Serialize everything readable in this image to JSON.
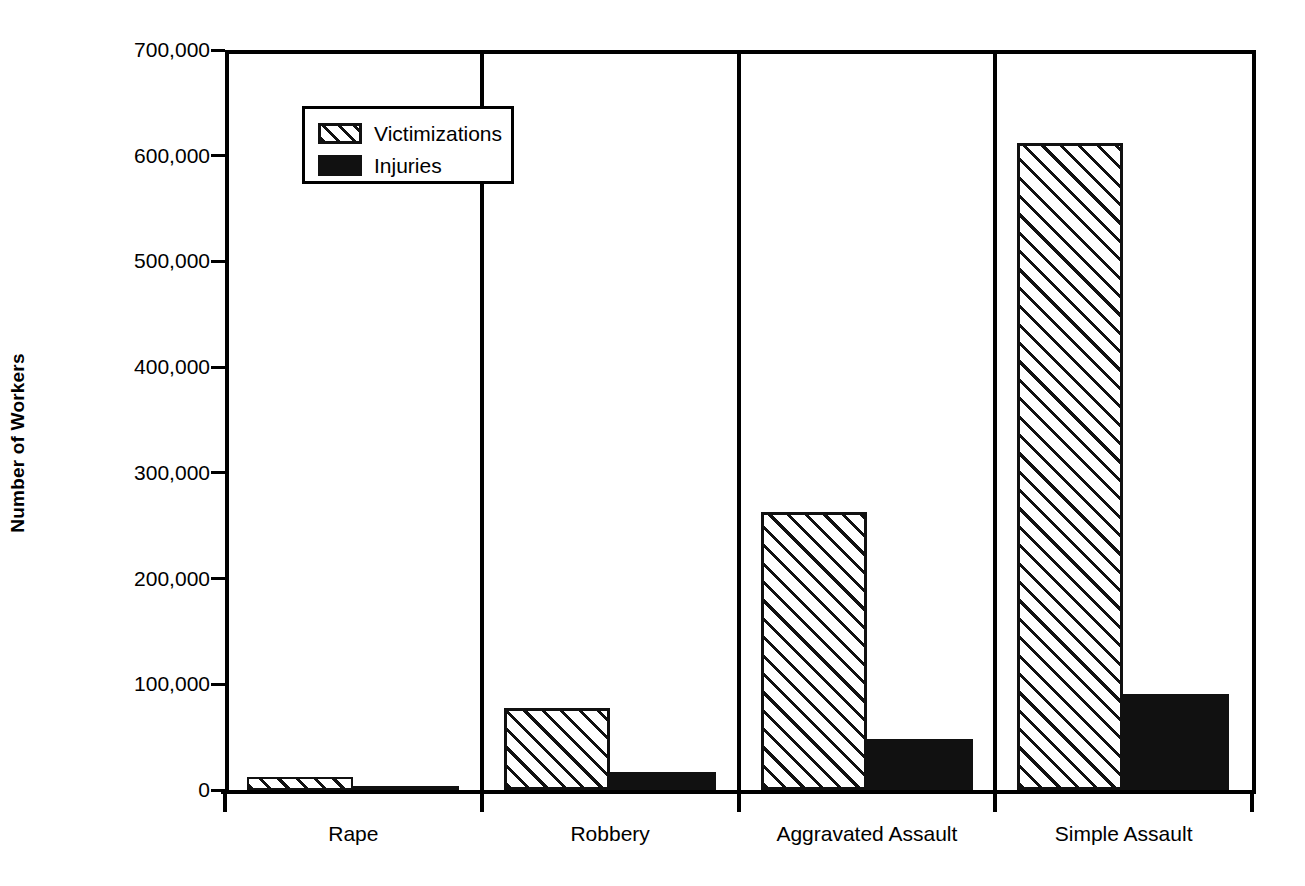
{
  "chart_data": {
    "type": "bar",
    "title": "",
    "xlabel": "",
    "ylabel": "Number of Workers",
    "ylim": [
      0,
      700000
    ],
    "yticks": [
      0,
      100000,
      200000,
      300000,
      400000,
      500000,
      600000,
      700000
    ],
    "ytick_labels": [
      "0",
      "100,000",
      "200,000",
      "300,000",
      "400,000",
      "500,000",
      "600,000",
      "700,000"
    ],
    "categories": [
      "Rape",
      "Robbery",
      "Aggravated Assault",
      "Simple Assault"
    ],
    "grid": false,
    "legend_position": "upper-left-inside",
    "series": [
      {
        "name": "Victimizations",
        "fill": "diagonal-hatch",
        "color": "#111111",
        "values": [
          12000,
          78000,
          263000,
          612000
        ]
      },
      {
        "name": "Injuries",
        "fill": "solid",
        "color": "#111111",
        "values": [
          3000,
          17000,
          48000,
          91000
        ]
      }
    ]
  },
  "legend": {
    "items": [
      {
        "label": "Victimizations",
        "swatch": "hatch-swatch"
      },
      {
        "label": "Injuries",
        "swatch": "solid-swatch"
      }
    ]
  },
  "axis": {
    "y_title": "Number of Workers"
  }
}
